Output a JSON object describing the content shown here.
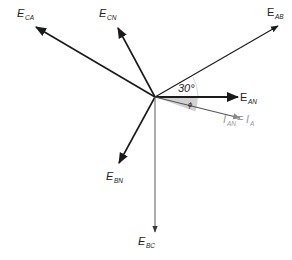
{
  "diagram": {
    "type": "phasor-diagram",
    "origin": {
      "x": 155,
      "y": 97
    },
    "colors": {
      "voltage_phasor": "#1a1a1a",
      "current_phasor": "#8a8a8a",
      "bc_phasor": "#5a5a5a",
      "phi_sector": "#cfcfcf"
    },
    "phasors": [
      {
        "id": "E_CA",
        "label_main": "E",
        "label_sub": "CA",
        "end": {
          "x": 36,
          "y": 27
        }
      },
      {
        "id": "E_CN",
        "label_main": "E",
        "label_sub": "CN",
        "end": {
          "x": 118,
          "y": 28
        }
      },
      {
        "id": "E_AB",
        "label_main": "E",
        "label_sub": "AB",
        "end": {
          "x": 278,
          "y": 26
        }
      },
      {
        "id": "E_AN",
        "label_main": "E",
        "label_sub": "AN",
        "end": {
          "x": 238,
          "y": 97
        }
      },
      {
        "id": "I_AN",
        "label_main": "I",
        "label_sub": "AN",
        "label_rhs_main": "I",
        "label_rhs_sub": "A",
        "equals": "=",
        "end": {
          "x": 240,
          "y": 118
        }
      },
      {
        "id": "E_BN",
        "label_main": "E",
        "label_sub": "BN",
        "end": {
          "x": 119,
          "y": 163
        }
      },
      {
        "id": "E_BC",
        "label_main": "E",
        "label_sub": "BC",
        "end": {
          "x": 155,
          "y": 232
        }
      }
    ],
    "annotations": {
      "angle_30": "30°",
      "angle_phi": "ϕ"
    }
  }
}
